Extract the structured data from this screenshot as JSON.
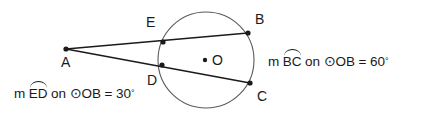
{
  "figure": {
    "type": "circle-with-two-secants",
    "points": [
      {
        "id": "A",
        "label": "A",
        "x": 66,
        "y": 49,
        "on_circle": false,
        "role": "external-point"
      },
      {
        "id": "E",
        "label": "E",
        "x": 163,
        "y": 42,
        "on_circle": true,
        "role": "near-intersection-upper"
      },
      {
        "id": "B",
        "label": "B",
        "x": 248,
        "y": 33,
        "on_circle": true,
        "role": "far-intersection-upper"
      },
      {
        "id": "D",
        "label": "D",
        "x": 162,
        "y": 65,
        "on_circle": true,
        "role": "near-intersection-lower"
      },
      {
        "id": "C",
        "label": "C",
        "x": 250,
        "y": 83,
        "on_circle": true,
        "role": "far-intersection-lower"
      },
      {
        "id": "O",
        "label": "O",
        "x": 205,
        "y": 60,
        "on_circle": false,
        "role": "center"
      }
    ],
    "point_label_positions": [
      {
        "id": "A",
        "x": 61,
        "y": 67
      },
      {
        "id": "E",
        "x": 146,
        "y": 27
      },
      {
        "id": "B",
        "x": 255,
        "y": 24
      },
      {
        "id": "D",
        "x": 147,
        "y": 85
      },
      {
        "id": "C",
        "x": 257,
        "y": 101
      },
      {
        "id": "O",
        "x": 212,
        "y": 65
      }
    ],
    "circle": {
      "cx": 206,
      "cy": 60,
      "r": 48,
      "label": "O"
    },
    "segments": [
      {
        "id": "secant-ab",
        "from": "A",
        "to": "B",
        "through": "E"
      },
      {
        "id": "secant-ac",
        "from": "A",
        "to": "C",
        "through": "D"
      }
    ],
    "stroke_color": "#1a1a1a",
    "circle_color": "#5a5a5a",
    "background": "#ffffff"
  },
  "annotations": {
    "arc_bc": {
      "id": "arc-bc-equation",
      "measure_prefix": "m",
      "arc_name": "BC",
      "connector": "on",
      "circle_symbol": "⊙",
      "circle_name": "OB",
      "equals": "=",
      "value": "60",
      "degree_symbol": "°",
      "full_text": "m BC on ⊙OB = 60°"
    },
    "arc_ed": {
      "id": "arc-ed-equation",
      "measure_prefix": "m",
      "arc_name": "ED",
      "connector": "on",
      "circle_symbol": "⊙",
      "circle_name": "OB",
      "equals": "=",
      "value": "30",
      "degree_symbol": "°",
      "full_text": "m ED on ⊙OB = 30°"
    }
  }
}
